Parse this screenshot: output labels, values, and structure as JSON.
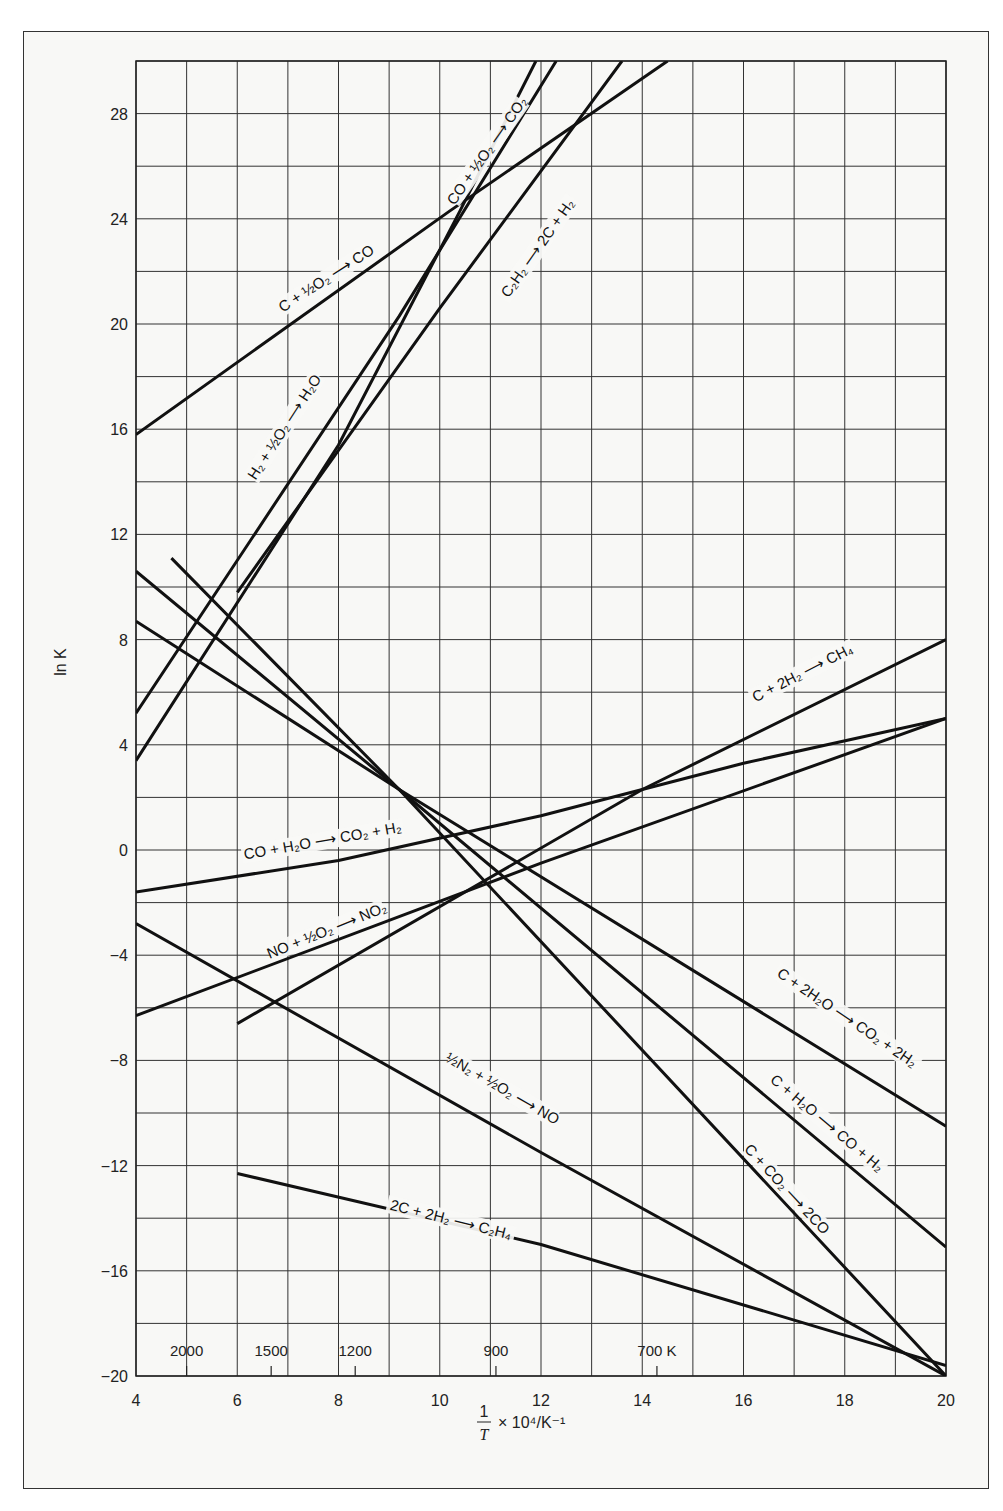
{
  "chart_data": {
    "type": "line",
    "title": "",
    "xlabel": "1/T × 10^4/K^-1",
    "ylabel": "ln K",
    "xlim": [
      4,
      20
    ],
    "ylim": [
      -20,
      30
    ],
    "grid": true,
    "x_ticks": [
      4,
      6,
      8,
      10,
      12,
      14,
      16,
      18,
      20
    ],
    "y_ticks": [
      -20,
      -16,
      -12,
      -8,
      -4,
      0,
      4,
      8,
      12,
      16,
      20,
      24,
      28
    ],
    "temperature_ticks": [
      {
        "label": "2000",
        "x": 5.0
      },
      {
        "label": "1500",
        "x": 6.67
      },
      {
        "label": "1200",
        "x": 8.33
      },
      {
        "label": "900",
        "x": 11.11
      },
      {
        "label": "700 K",
        "x": 14.29
      }
    ],
    "series": [
      {
        "name": "C + ½O2 → CO",
        "points": [
          [
            4,
            15.8
          ],
          [
            10.2,
            24.3
          ],
          [
            14.5,
            30
          ]
        ],
        "label_pos": [
          7.8,
          21.6
        ],
        "label_angle": -33
      },
      {
        "name": "CO + ½O2 → CO2",
        "points": [
          [
            4,
            3.4
          ],
          [
            8,
            15.4
          ],
          [
            10.4,
            24.3
          ],
          [
            11.9,
            30
          ]
        ],
        "label_pos": [
          11.0,
          26.5
        ],
        "label_angle": -55
      },
      {
        "name": "H2 + ½O2 → H2O",
        "points": [
          [
            4,
            5.2
          ],
          [
            9.2,
            20.3
          ],
          [
            12.3,
            30
          ]
        ],
        "label_pos": [
          7.0,
          16.0
        ],
        "label_angle": -57
      },
      {
        "name": "C2H2 → 2C + H2",
        "points": [
          [
            6,
            9.8
          ],
          [
            10,
            20.6
          ],
          [
            13.6,
            30
          ]
        ],
        "label_pos": [
          12.0,
          22.8
        ],
        "label_angle": -55
      },
      {
        "name": "C + 2H2 → CH4",
        "points": [
          [
            6,
            -6.6
          ],
          [
            14,
            2.3
          ],
          [
            20,
            8.0
          ]
        ],
        "label_pos": [
          17.2,
          6.6
        ],
        "label_angle": -27
      },
      {
        "name": "CO + H2O → CO2 + H2",
        "points": [
          [
            4,
            -1.6
          ],
          [
            8,
            -0.4
          ],
          [
            12,
            1.3
          ],
          [
            16,
            3.3
          ],
          [
            20,
            5.0
          ]
        ],
        "label_pos": [
          7.7,
          0.2
        ],
        "label_angle": -10
      },
      {
        "name": "NO + ½O2 → NO2",
        "points": [
          [
            4,
            -6.3
          ],
          [
            12,
            -0.5
          ],
          [
            20,
            5.0
          ]
        ],
        "label_pos": [
          7.8,
          -3.2
        ],
        "label_angle": -22
      },
      {
        "name": "½N2 + ½O2 → NO",
        "points": [
          [
            4,
            -2.8
          ],
          [
            12,
            -11.5
          ],
          [
            20,
            -20
          ]
        ],
        "label_pos": [
          11.2,
          -9.2
        ],
        "label_angle": 30
      },
      {
        "name": "C + 2H2O → CO2 + 2H2",
        "points": [
          [
            4,
            8.7
          ],
          [
            9.2,
            2.3
          ],
          [
            20,
            -10.5
          ]
        ],
        "label_pos": [
          18.0,
          -6.5
        ],
        "label_angle": 34
      },
      {
        "name": "C + H2O → CO + H2",
        "points": [
          [
            4,
            10.6
          ],
          [
            9.2,
            2.3
          ],
          [
            20,
            -15.1
          ]
        ],
        "label_pos": [
          17.6,
          -10.5
        ],
        "label_angle": 40
      },
      {
        "name": "C + CO2 → 2CO",
        "points": [
          [
            4.7,
            11.1
          ],
          [
            9.2,
            2.3
          ],
          [
            20,
            -20
          ]
        ],
        "label_pos": [
          16.8,
          -13.0
        ],
        "label_angle": 47
      },
      {
        "name": "2C + 2H2 → C2H4",
        "points": [
          [
            6,
            -12.3
          ],
          [
            12,
            -15.0
          ],
          [
            20,
            -19.6
          ]
        ],
        "label_pos": [
          10.2,
          -14.2
        ],
        "label_angle": 14
      }
    ]
  },
  "axis": {
    "ylabel": "ln K",
    "xlabel_fraction_num": "1",
    "xlabel_fraction_den": "T",
    "xlabel_rest": "× 10⁴/K⁻¹"
  },
  "labels": [
    {
      "html_id": "lbl-co",
      "text": "C + ½O₂ ⟶ CO"
    },
    {
      "html_id": "lbl-co2",
      "text": "CO + ½O₂ ⟶ CO₂"
    },
    {
      "html_id": "lbl-h2o",
      "text": "H₂ + ½O₂ ⟶ H₂O"
    },
    {
      "html_id": "lbl-c2h2",
      "text": "C₂H₂ ⟶ 2C + H₂"
    },
    {
      "html_id": "lbl-ch4",
      "text": "C + 2H₂ ⟶ CH₄"
    },
    {
      "html_id": "lbl-wgs",
      "text": "CO + H₂O ⟶ CO₂ + H₂"
    },
    {
      "html_id": "lbl-no2",
      "text": "NO + ½O₂ ⟶ NO₂"
    },
    {
      "html_id": "lbl-no",
      "text": "½N₂ + ½O₂ ⟶ NO"
    },
    {
      "html_id": "lbl-c2h2o",
      "text": "C + 2H₂O ⟶ CO₂ + 2H₂"
    },
    {
      "html_id": "lbl-ch2o",
      "text": "C + H₂O ⟶ CO + H₂"
    },
    {
      "html_id": "lbl-cco2",
      "text": "C + CO₂ ⟶ 2CO"
    },
    {
      "html_id": "lbl-c2h4",
      "text": "2C + 2H₂ ⟶ C₂H₄"
    }
  ]
}
